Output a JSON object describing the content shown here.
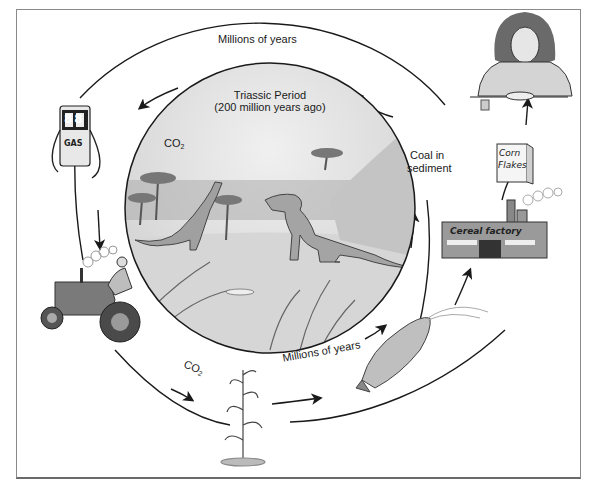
{
  "diagram": {
    "title_fragment": "",
    "inner_scene": {
      "title": "Triassic Period",
      "subtitle": "(200 million years ago)",
      "co2_label": "CO",
      "co2_subscript": "2"
    },
    "outer_labels": {
      "top": "Millions of years",
      "bottom_inner": "Millions of years",
      "coal": "Coal in",
      "coal_line2": "sediment",
      "co2_bottom": "CO",
      "co2_bottom_subscript": "2"
    },
    "illustrations": {
      "gas_pump": {
        "display": "88",
        "label": "GAS"
      },
      "cereal_box": {
        "line1": "Corn",
        "line2": "Flakes"
      },
      "factory": {
        "label": "Cereal factory"
      },
      "girl_eating": "girl eating cereal",
      "tractor": "tractor with farmer",
      "corn_plant": "corn stalk",
      "corn_cob": "ear of corn",
      "dinosaurs": "Triassic dinosaurs"
    },
    "colors": {
      "line": "#1a1a1a",
      "scene_sky": "#dcdcdc",
      "scene_ground": "#c8c8c8",
      "frame": "#8a8a8a"
    }
  }
}
